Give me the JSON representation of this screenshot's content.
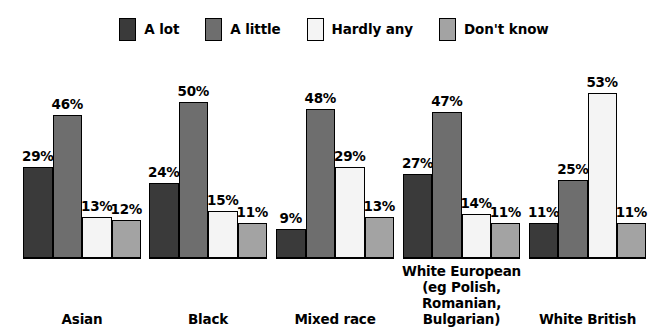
{
  "legend": {
    "items": [
      {
        "label": "A lot",
        "color": "#3a3a3a",
        "icon": "legend-swatch-a-lot"
      },
      {
        "label": "A little",
        "color": "#6e6e6e",
        "icon": "legend-swatch-a-little"
      },
      {
        "label": "Hardly any",
        "color": "#f4f4f4",
        "icon": "legend-swatch-hardly-any"
      },
      {
        "label": "Don't know",
        "color": "#a3a3a3",
        "icon": "legend-swatch-dont-know"
      }
    ]
  },
  "chart_data": {
    "type": "bar",
    "title": "",
    "subtitle": "",
    "xlabel": "",
    "ylabel": "",
    "ylim": [
      0,
      60
    ],
    "grid": false,
    "legend_position": "top-center",
    "value_suffix": "%",
    "categories": [
      "Asian",
      "Black",
      "Mixed race",
      "White European (eg Polish, Romanian, Bulgarian)",
      "White British"
    ],
    "category_lines": [
      [
        "Asian"
      ],
      [
        "Black"
      ],
      [
        "Mixed race"
      ],
      [
        "White European",
        "(eg Polish,",
        "Romanian,",
        "Bulgarian)"
      ],
      [
        "White British"
      ]
    ],
    "series": [
      {
        "name": "A lot",
        "color": "#3a3a3a",
        "values": [
          29,
          24,
          9,
          27,
          11
        ]
      },
      {
        "name": "A little",
        "color": "#6e6e6e",
        "values": [
          46,
          50,
          48,
          47,
          25
        ]
      },
      {
        "name": "Hardly any",
        "color": "#f4f4f4",
        "values": [
          13,
          15,
          29,
          14,
          53
        ]
      },
      {
        "name": "Don't know",
        "color": "#a3a3a3",
        "values": [
          12,
          11,
          13,
          11,
          11
        ]
      }
    ],
    "value_labels": [
      [
        "29%",
        "46%",
        "13%",
        "12%"
      ],
      [
        "24%",
        "50%",
        "15%",
        "11%"
      ],
      [
        "9%",
        "48%",
        "29%",
        "13%"
      ],
      [
        "27%",
        "47%",
        "14%",
        "11%"
      ],
      [
        "11%",
        "25%",
        "53%",
        "11%"
      ]
    ]
  }
}
